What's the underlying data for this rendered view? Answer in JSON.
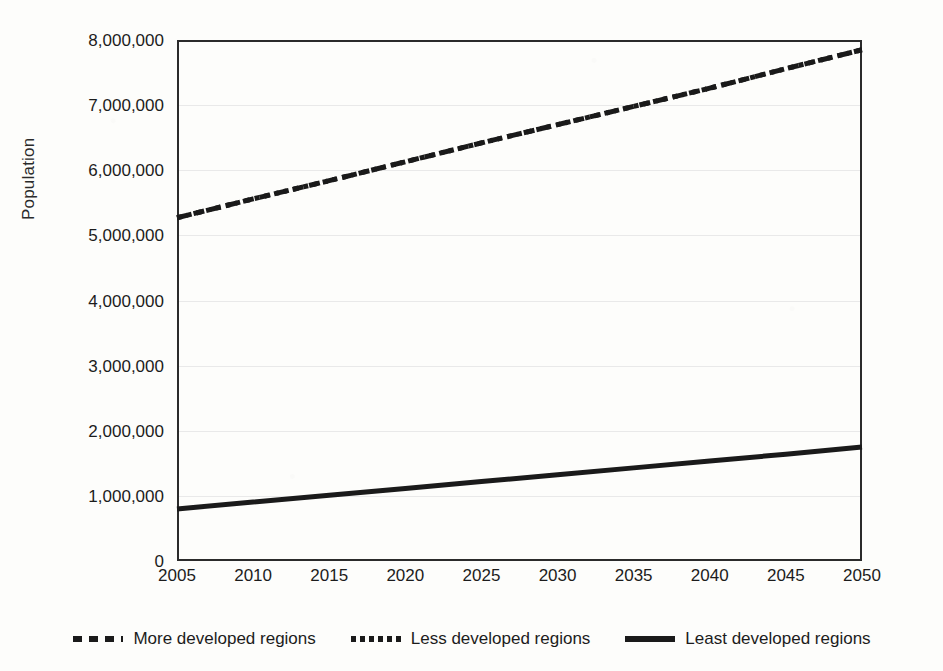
{
  "chart_data": {
    "type": "line",
    "title": "",
    "xlabel": "",
    "ylabel": "Population",
    "x": [
      2005,
      2010,
      2015,
      2020,
      2025,
      2030,
      2035,
      2040,
      2045,
      2050
    ],
    "xlim": [
      2005,
      2050
    ],
    "ylim": [
      0,
      8000000
    ],
    "grid": true,
    "legend_position": "bottom",
    "x_tick_labels": [
      "2005",
      "2010",
      "2015",
      "2020",
      "2025",
      "2030",
      "2035",
      "2040",
      "2045",
      "2050"
    ],
    "y_tick_labels": [
      "0",
      "1,000,000",
      "2,000,000",
      "3,000,000",
      "4,000,000",
      "5,000,000",
      "6,000,000",
      "7,000,000",
      "8,000,000"
    ],
    "y_tick_values": [
      0,
      1000000,
      2000000,
      3000000,
      4000000,
      5000000,
      6000000,
      7000000,
      8000000
    ],
    "series": [
      {
        "name": "More developed regions",
        "style": "dashed",
        "color": "#1a1a1a",
        "values": [
          5270000,
          5560000,
          5840000,
          6130000,
          6420000,
          6700000,
          6980000,
          7260000,
          7560000,
          7850000
        ]
      },
      {
        "name": "Less developed regions",
        "style": "dotted",
        "color": "#1a1a1a",
        "values": [
          5270000,
          5560000,
          5840000,
          6130000,
          6420000,
          6700000,
          6980000,
          7260000,
          7560000,
          7850000
        ]
      },
      {
        "name": "Least developed regions",
        "style": "solid",
        "color": "#1a1a1a",
        "values": [
          800000,
          905000,
          1010000,
          1115000,
          1220000,
          1325000,
          1430000,
          1535000,
          1640000,
          1750000
        ]
      }
    ]
  },
  "legend": {
    "items": [
      {
        "label": "More developed regions",
        "style": "dashed"
      },
      {
        "label": "Less developed regions",
        "style": "dotted"
      },
      {
        "label": "Least developed regions",
        "style": "solid"
      }
    ]
  }
}
